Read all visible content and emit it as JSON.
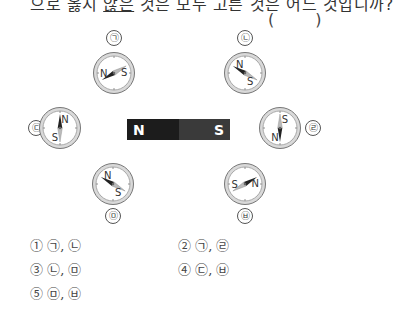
{
  "question": {
    "text_before": "으로 옳지 ",
    "text_underlined": "않은",
    "text_after": " 것은 모두 고른 것은 어느 것입니까?",
    "answer_blank": "( )"
  },
  "magnet": {
    "north_label": "N",
    "south_label": "S"
  },
  "compasses": [
    {
      "id": "ㄱ",
      "label": "㉠",
      "needle_north_deg": 150,
      "n_text": "N",
      "s_text": "S"
    },
    {
      "id": "ㄴ",
      "label": "㉡",
      "needle_north_deg": 210,
      "n_text": "N",
      "s_text": "S"
    },
    {
      "id": "ㄷ",
      "label": "㉢",
      "needle_north_deg": 270,
      "n_text": "N",
      "s_text": "S"
    },
    {
      "id": "ㄹ",
      "label": "㉣",
      "needle_north_deg": 90,
      "n_text": "N",
      "s_text": "S"
    },
    {
      "id": "ㅁ",
      "label": "㉤",
      "needle_north_deg": 210,
      "n_text": "N",
      "s_text": "S"
    },
    {
      "id": "ㅂ",
      "label": "㉥",
      "needle_north_deg": 330,
      "n_text": "N",
      "s_text": "S"
    }
  ],
  "options": [
    {
      "number": "①",
      "text": "㉠, ㉡"
    },
    {
      "number": "②",
      "text": "㉠, ㉣"
    },
    {
      "number": "③",
      "text": "㉡, ㉤"
    },
    {
      "number": "④",
      "text": "㉢, ㉥"
    },
    {
      "number": "⑤",
      "text": "㉤, ㉥"
    }
  ],
  "colors": {
    "magnet_north": "#1c1c1c",
    "magnet_south": "#3a3a3a",
    "needle_north": "#222222",
    "needle_south": "#bbbbbb",
    "ring": "#888888"
  }
}
